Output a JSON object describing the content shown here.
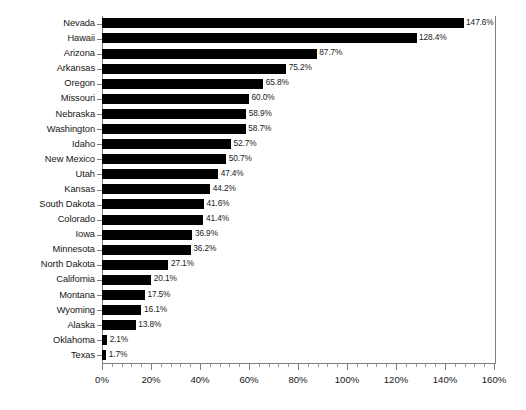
{
  "chart_data": {
    "type": "bar",
    "orientation": "horizontal",
    "title": "",
    "subtitle": "",
    "xlabel": "",
    "ylabel": "",
    "xlim": [
      0,
      160
    ],
    "xtick_step": 20,
    "x_minor_step": 4,
    "grid": false,
    "legend": false,
    "legend_position": "none",
    "value_suffix": "%",
    "bar_color": "#000000",
    "axis_color": "#7f7f7f",
    "background_color": "#ffffff",
    "categories": [
      "Nevada",
      "Hawaii",
      "Arizona",
      "Arkansas",
      "Oregon",
      "Missouri",
      "Nebraska",
      "Washington",
      "Idaho",
      "New Mexico",
      "Utah",
      "Kansas",
      "South Dakota",
      "Colorado",
      "Iowa",
      "Minnesota",
      "North Dakota",
      "California",
      "Montana",
      "Wyoming",
      "Alaska",
      "Oklahoma",
      "Texas"
    ],
    "values": [
      147.6,
      128.4,
      87.7,
      75.2,
      65.8,
      60.0,
      58.9,
      58.7,
      52.7,
      50.7,
      47.4,
      44.2,
      41.6,
      41.4,
      36.9,
      36.2,
      27.1,
      20.1,
      17.5,
      16.1,
      13.8,
      2.1,
      1.7
    ],
    "data_labels": [
      "147.6%",
      "128.4%",
      "87.7%",
      "75.2%",
      "65.8%",
      "60.0%",
      "58.9%",
      "58.7%",
      "52.7%",
      "50.7%",
      "47.4%",
      "44.2%",
      "41.6%",
      "41.4%",
      "36.9%",
      "36.2%",
      "27.1%",
      "20.1%",
      "17.5%",
      "16.1%",
      "13.8%",
      "2.1%",
      "1.7%"
    ],
    "xtick_labels": [
      "0%",
      "20%",
      "40%",
      "60%",
      "80%",
      "100%",
      "120%",
      "140%",
      "160%"
    ],
    "xtick_values": [
      0,
      20,
      40,
      60,
      80,
      100,
      120,
      140,
      160
    ]
  }
}
